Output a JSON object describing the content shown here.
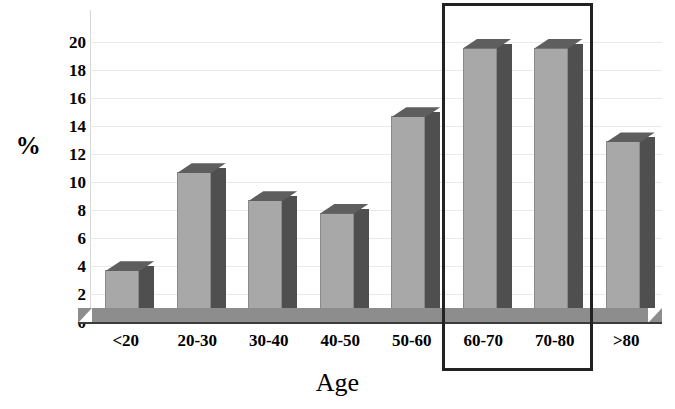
{
  "chart_data": {
    "type": "bar",
    "title": "",
    "subtitle": "",
    "xlabel": "Age",
    "ylabel": "%",
    "categories": [
      "<20",
      "20-30",
      "30-40",
      "40-50",
      "50-60",
      "60-70",
      "70-80",
      ">80"
    ],
    "values": [
      3.7,
      10.7,
      8.7,
      7.8,
      14.7,
      19.6,
      19.6,
      12.9
    ],
    "series": [
      {
        "name": "Percent of patients",
        "values": [
          3.7,
          10.7,
          8.7,
          7.8,
          14.7,
          19.6,
          19.6,
          12.9
        ]
      }
    ],
    "ylim": [
      0,
      20
    ],
    "yticks": [
      0,
      2,
      4,
      6,
      8,
      10,
      12,
      14,
      16,
      18,
      20
    ],
    "ytick_labels": [
      "0",
      "2",
      "4",
      "6",
      "8",
      "10",
      "12",
      "14",
      "16",
      "18",
      "20"
    ],
    "xtick_labels": [
      "<20",
      "20-30",
      "30-40",
      "40-50",
      "50-60",
      "60-70",
      "70-80",
      ">80"
    ],
    "grid": true,
    "grid_axis": "y",
    "legend": false,
    "legend_position": "none",
    "style": "3d-column",
    "annotations": [
      {
        "kind": "highlight-rectangle",
        "label": "",
        "covers_categories": [
          "60-70",
          "70-80"
        ],
        "color": "#222222"
      }
    ],
    "colors": {
      "bar_front": "#a8a8a8",
      "bar_top": "#5e5e5e",
      "bar_side": "#4f4f4f",
      "floor": "#8d8d8d",
      "baseline": "#3b3b3b",
      "gridline": "#e9e9e9",
      "text": "#000000",
      "highlight": "#222222"
    }
  }
}
